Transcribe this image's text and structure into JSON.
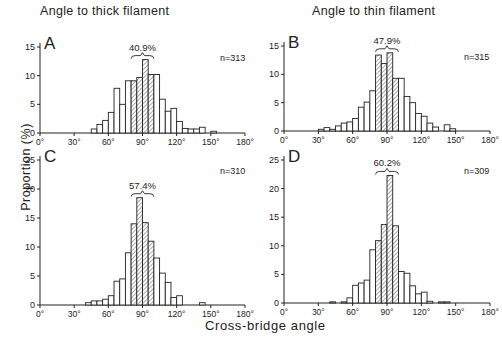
{
  "figure": {
    "column_titles": [
      "Angle to thick filament",
      "Angle to thin filament"
    ],
    "ylabel": "Proportion (%)",
    "xlabel": "Cross-bridge angle"
  },
  "chart_data": [
    {
      "type": "bar",
      "panel": "A",
      "column": "Angle to thick filament",
      "annotation": "40.9%",
      "n_label": "n=313",
      "xlabel": "Cross-bridge angle",
      "ylabel": "Proportion (%)",
      "xlim": [
        0,
        180
      ],
      "ylim": [
        0,
        15
      ],
      "yticks": [
        0,
        5,
        10,
        15
      ],
      "xticks": [
        "0°",
        "30°",
        "60°",
        "90°",
        "120°",
        "150°",
        "180°"
      ],
      "bin_width_deg": 5,
      "hatched_range": [
        80,
        100
      ],
      "bins_start": [
        45,
        50,
        55,
        60,
        65,
        70,
        75,
        80,
        85,
        90,
        95,
        100,
        105,
        110,
        115,
        120,
        125,
        130,
        135,
        140,
        145,
        150
      ],
      "values": [
        0.7,
        1.5,
        2.2,
        3.6,
        7.8,
        5.0,
        9.1,
        9.1,
        9.7,
        12.8,
        10.2,
        10.2,
        5.9,
        3.8,
        4.3,
        2.0,
        0.8,
        0.7,
        0.7,
        1.0,
        0,
        0.3
      ]
    },
    {
      "type": "bar",
      "panel": "B",
      "column": "Angle to thin filament",
      "annotation": "47.9%",
      "n_label": "n=315",
      "xlabel": "Cross-bridge angle",
      "ylabel": "Proportion (%)",
      "xlim": [
        0,
        180
      ],
      "ylim": [
        0,
        15
      ],
      "yticks": [
        0,
        5,
        10,
        15
      ],
      "xticks": [
        "0°",
        "30°",
        "60°",
        "90°",
        "120°",
        "150°",
        "180°"
      ],
      "bin_width_deg": 5,
      "hatched_range": [
        80,
        100
      ],
      "bins_start": [
        30,
        35,
        40,
        45,
        50,
        55,
        60,
        65,
        70,
        75,
        80,
        85,
        90,
        95,
        100,
        105,
        110,
        115,
        120,
        125,
        130,
        135,
        140,
        145
      ],
      "values": [
        0.3,
        0.6,
        0.3,
        0.9,
        1.4,
        1.6,
        2.2,
        4.2,
        5.1,
        7.1,
        13.4,
        11.9,
        13.8,
        9.3,
        9.3,
        6.1,
        5.0,
        3.1,
        2.6,
        1.4,
        0.7,
        0,
        1.1,
        0.4
      ]
    },
    {
      "type": "bar",
      "panel": "C",
      "column": "Angle to thick filament",
      "annotation": "57.4%",
      "n_label": "n=310",
      "xlabel": "Cross-bridge angle",
      "ylabel": "Proportion (%)",
      "xlim": [
        0,
        180
      ],
      "ylim": [
        0,
        25
      ],
      "yticks": [
        0,
        5,
        10,
        15,
        20,
        25
      ],
      "xticks": [
        "0°",
        "30°",
        "60°",
        "90°",
        "120°",
        "150°",
        "180°"
      ],
      "bin_width_deg": 5,
      "hatched_range": [
        80,
        100
      ],
      "bins_start": [
        40,
        45,
        50,
        55,
        60,
        65,
        70,
        75,
        80,
        85,
        90,
        95,
        100,
        105,
        110,
        115,
        120,
        125,
        130,
        135,
        140
      ],
      "values": [
        0.4,
        0.7,
        0.7,
        1.0,
        1.6,
        4.1,
        4.5,
        9.0,
        14.0,
        18.5,
        14.2,
        11.0,
        8.1,
        5.5,
        3.9,
        1.3,
        1.6,
        0,
        0,
        0,
        0.4
      ]
    },
    {
      "type": "bar",
      "panel": "D",
      "column": "Angle to thin filament",
      "annotation": "60.2%",
      "n_label": "n=309",
      "xlabel": "Cross-bridge angle",
      "ylabel": "Proportion (%)",
      "xlim": [
        0,
        180
      ],
      "ylim": [
        0,
        25
      ],
      "yticks": [
        0,
        5,
        10,
        15,
        20,
        25
      ],
      "xticks": [
        "0°",
        "30°",
        "60°",
        "90°",
        "120°",
        "150°",
        "180°"
      ],
      "bin_width_deg": 5,
      "hatched_range": [
        80,
        100
      ],
      "bins_start": [
        40,
        45,
        50,
        55,
        60,
        65,
        70,
        75,
        80,
        85,
        90,
        95,
        100,
        105,
        110,
        115,
        120,
        125,
        130,
        135,
        140
      ],
      "values": [
        0.2,
        0,
        0.2,
        0.9,
        3.1,
        3.5,
        4.0,
        9.3,
        10.9,
        13.7,
        22.3,
        13.5,
        5.5,
        5.2,
        3.0,
        1.6,
        1.9,
        0.3,
        0,
        0.2,
        0.2
      ]
    }
  ],
  "layout": {
    "panels": [
      {
        "x0": 40,
        "baseline": 133,
        "x180": 245,
        "ytop_val": 15,
        "ytop_px": 47
      },
      {
        "x0": 284,
        "baseline": 131,
        "x180": 490,
        "ytop_val": 15,
        "ytop_px": 46
      },
      {
        "x0": 40,
        "baseline": 305,
        "x180": 245,
        "ytop_val": 25,
        "ytop_px": 160
      },
      {
        "x0": 284,
        "baseline": 303,
        "x180": 490,
        "ytop_val": 25,
        "ytop_px": 160
      }
    ]
  }
}
